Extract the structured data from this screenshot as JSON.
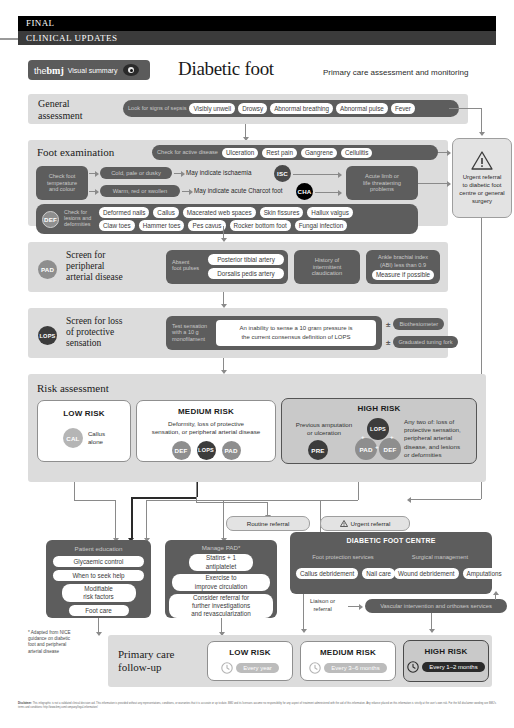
{
  "topbars": {
    "final": "FINAL",
    "clinical": "CLINICAL UPDATES"
  },
  "header": {
    "brand_the": "the",
    "brand_bmj": "bmj",
    "brand_visual_summary": "Visual summary",
    "eye_icon": "eye-icon",
    "title": "Diabetic foot",
    "subtitle": "Primary care assessment and monitoring"
  },
  "general_assessment": {
    "label": "General\nassessment",
    "label_l1": "General",
    "label_l2": "assessment",
    "bar_label": "Look for signs of sepsis",
    "pills": [
      "Visibly unwell",
      "Drowsy",
      "Abnormal breathing",
      "Abnormal pulse",
      "Fever"
    ]
  },
  "foot_examination": {
    "label": "Foot examination",
    "active_disease_label": "Check for active disease",
    "active_disease_pills": [
      "Ulceration",
      "Rest pain",
      "Gangrene",
      "Cellulitis"
    ],
    "temp_box_l1": "Check foot",
    "temp_box_l2": "temperature",
    "temp_box_l3": "and colour",
    "row1_pill": "Cold, pale or dusky",
    "row1_result": "May indicate ischaemia",
    "row1_code": "ISC",
    "row2_pill": "Warm, red or swollen",
    "row2_result": "May indicate acute Charcot foot",
    "row2_code": "CHA",
    "acute_box_l1": "Acute limb or",
    "acute_box_l2": "life threatening",
    "acute_box_l3": "problems",
    "lesions_code": "DEF",
    "lesions_label_l1": "Check for",
    "lesions_label_l2": "lesions and",
    "lesions_label_l3": "deformities",
    "lesions_row1": [
      "Deformed nails",
      "Callus",
      "Macerated web spaces",
      "Skin fissures",
      "Hallux valgus"
    ],
    "lesions_row2": [
      "Claw toes",
      "Hammer toes",
      "Pes cavus",
      "Rocker bottom foot",
      "Fungal infection"
    ]
  },
  "urgent_referral_box": {
    "warning_icon": "warning-triangle-icon",
    "l1": "Urgent referral",
    "l2": "to diabetic foot",
    "l3": "centre or general",
    "l4": "surgery"
  },
  "pad_section": {
    "code": "PAD",
    "title_l1": "Screen for",
    "title_l2": "peripheral",
    "title_l3": "arterial disease",
    "box1_label_l1": "Absent",
    "box1_label_l2": "foot pulses",
    "box1_pills": [
      "Posterior tibial artery",
      "Dorsalis pedis artery"
    ],
    "box2_l1": "History of",
    "box2_l2": "intermittent",
    "box2_l3": "claudication",
    "box3_l1": "Ankle brachial index",
    "box3_l2": "(ABI) less than 0.9",
    "box3_pill": "Measure if possible"
  },
  "lops_section": {
    "code": "LOPS",
    "title_l1": "Screen for loss",
    "title_l2": "of protective",
    "title_l3": "sensation",
    "box_label_l1": "Test sensation",
    "box_label_l2": "with a 10 g",
    "box_label_l3": "monofilament",
    "definition_l1": "An inability to sense a 10 gram pressure is",
    "definition_l2": "the current consensus definition of LOPS",
    "option1_symbol": "±",
    "option1": "Biothesiometer",
    "option2_symbol": "±",
    "option2": "Graduated tuning fork"
  },
  "risk_assessment": {
    "label": "Risk assessment",
    "low": {
      "title": "LOW RISK",
      "code": "CAL",
      "desc_l1": "Callus",
      "desc_l2": "alone"
    },
    "medium": {
      "title": "MEDIUM RISK",
      "desc_l1": "Deformity, loss of protective",
      "desc_l2": "sensation, or peripheral arterial disease",
      "codes": [
        "DEF",
        "LOPS",
        "PAD"
      ]
    },
    "high": {
      "title": "HIGH RISK",
      "left_l1": "Previous amputation",
      "left_l2": "or ulceration",
      "left_code": "PRE",
      "venn_top": "LOPS",
      "venn_left": "PAD",
      "venn_right": "DEF",
      "plus1": "+",
      "plus2": "+",
      "plus3": "+",
      "right_l1": "Any two of: loss of",
      "right_l2": "protective sensation,",
      "right_l3": "peripheral arterial",
      "right_l4": "disease, and lesions",
      "right_l5": "or deformities"
    }
  },
  "referrals": {
    "routine": "Routine referral",
    "urgent": "Urgent referral",
    "urgent_icon": "warning-triangle-icon"
  },
  "patient_education": {
    "title": "Patient education",
    "items": [
      "Glycaemic control",
      "When to seek help",
      "Modifiable\nrisk factors",
      "Foot care"
    ],
    "item3_l1": "Modifiable",
    "item3_l2": "risk factors"
  },
  "manage_pad": {
    "title": "Manage PAD*",
    "item1_l1": "Statins + 1",
    "item1_l2": "antiplatelet",
    "item2_l1": "Exercise to",
    "item2_l2": "improve circulation",
    "item3_l1": "Consider referral for",
    "item3_l2": "further investigations",
    "item3_l3": "and revascularization"
  },
  "diabetic_foot_centre": {
    "title": "DIABETIC FOOT CENTRE",
    "col1_title": "Foot protection services",
    "col1_pills": [
      "Callus debridement",
      "Nail care"
    ],
    "col2_title": "Surgical management",
    "col2_pills": [
      "Wound debridement",
      "Amputations"
    ],
    "liaison_l1": "Liaison or",
    "liaison_l2": "referral",
    "vascular_pill": "Vascular intervention and orthoses services"
  },
  "follow_up": {
    "label_l1": "Primary care",
    "label_l2": "follow-up",
    "clock_icon": "clock-icon",
    "cards": [
      {
        "title": "LOW RISK",
        "value": "Every year"
      },
      {
        "title": "MEDIUM RISK",
        "value": "Every 3–6 months"
      },
      {
        "title": "HIGH RISK",
        "value": "Every 1–2 months"
      }
    ]
  },
  "footnote": {
    "l1": "* Adapted from NICE",
    "l2": "guidance on diabetic",
    "l3": "foot and peripheral",
    "l4": "arterial disease"
  },
  "disclaimer": {
    "label": "Disclaimer:",
    "text": "This infographic is not a validated clinical decision aid. This information is provided without any representations, conditions, or warranties that it is accurate or up to date. BMJ and its licensors assume no responsibility for any aspect of treatment administered with the aid of this information. Any reliance placed on this information is strictly at the user's own risk. For the full disclaimer wording see BMJ's terms and conditions: http://www.bmj.com/company/legal-information/"
  },
  "colors": {
    "dark_gray": "#5d5d5d",
    "band_gray": "#dcdcdc",
    "black": "#000000",
    "white": "#ffffff",
    "arrow": "#8a8a8a"
  }
}
